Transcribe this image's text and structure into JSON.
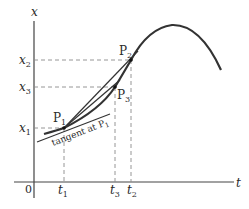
{
  "diagram": {
    "axes": {
      "vertical_label": "x",
      "horizontal_label": "t",
      "origin_label": "0"
    },
    "x_ticks": [
      {
        "name": "x",
        "sub": "2"
      },
      {
        "name": "x",
        "sub": "3"
      },
      {
        "name": "x",
        "sub": "1"
      }
    ],
    "t_ticks": [
      {
        "name": "t",
        "sub": "1"
      },
      {
        "name": "t",
        "sub": "3"
      },
      {
        "name": "t",
        "sub": "2"
      }
    ],
    "points": [
      {
        "name": "P",
        "sub": "1"
      },
      {
        "name": "P",
        "sub": "2"
      },
      {
        "name": "P",
        "sub": "3"
      }
    ],
    "annotation": {
      "text": "tangent at P",
      "sub": "1"
    },
    "colors": {
      "stroke": "#2a2a2a",
      "dash": "#8a8a8a"
    }
  }
}
